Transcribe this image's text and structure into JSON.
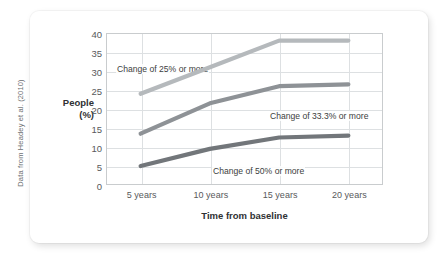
{
  "source_note": "Data from Headey et al. (2010)",
  "chart_data": {
    "type": "line",
    "title": "",
    "subtitle": "",
    "xlabel": "Time from baseline",
    "ylabel": "People (%)",
    "ylabel_line1": "People",
    "ylabel_line2": "(%)",
    "categories": [
      "5 years",
      "10 years",
      "15 years",
      "20 years"
    ],
    "x_values": [
      5,
      10,
      15,
      20
    ],
    "ylim": [
      0,
      40
    ],
    "yticks": [
      0,
      5,
      10,
      15,
      20,
      25,
      30,
      35,
      40
    ],
    "ytick_labels": [
      "0",
      "5",
      "10",
      "15",
      "20",
      "25",
      "30",
      "35",
      "40"
    ],
    "grid": true,
    "legend_position": "inline-annotations",
    "series": [
      {
        "name": "Change of 25% or more",
        "label": "Change of 25% or more",
        "color": "#b5b9bc",
        "values": [
          24,
          31,
          38,
          38
        ]
      },
      {
        "name": "Change of 33.3% or more",
        "label": "Change of 33.3% or more",
        "color": "#8e9296",
        "values": [
          13.5,
          21.5,
          26,
          26.5
        ]
      },
      {
        "name": "Change of 50% or more",
        "label": "Change of 50% or more",
        "color": "#72767a",
        "values": [
          5,
          9.5,
          12.5,
          13
        ]
      }
    ]
  }
}
